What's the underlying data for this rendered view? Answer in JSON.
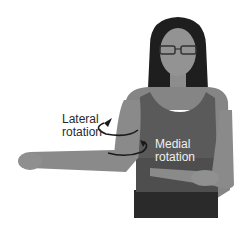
{
  "figure": {
    "labels": {
      "lateral": [
        "Lateral",
        "rotation"
      ],
      "medial": [
        "Medial",
        "rotation"
      ]
    },
    "colors": {
      "background": "#ffffff",
      "skin": "#8a8a8a",
      "hair": "#1e1e1e",
      "top": "#5a5a5a",
      "pants": "#2a2a2a",
      "arrow": "#1a1a1a"
    }
  }
}
